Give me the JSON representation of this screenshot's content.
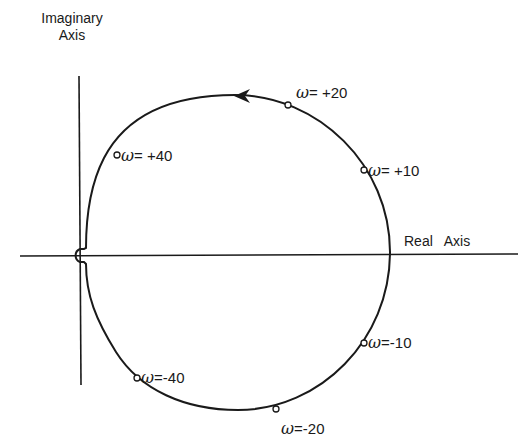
{
  "diagram": {
    "type": "nyquist-plot",
    "colors": {
      "line": "#1a1a1a",
      "background": "#ffffff"
    },
    "axes": {
      "imaginary_label_line1": "Imaginary",
      "imaginary_label_line2": "Axis",
      "real_label": "Real   Axis"
    },
    "points": [
      {
        "symbol": "ω",
        "eq": "= +20",
        "label": "ω= +20"
      },
      {
        "symbol": "ω",
        "eq": "= +40",
        "label": "ω= +40"
      },
      {
        "symbol": "ω",
        "eq": "= +10",
        "label": "ω= +10"
      },
      {
        "symbol": "ω",
        "eq": "=-10",
        "label": "ω=-10"
      },
      {
        "symbol": "ω",
        "eq": "=-40",
        "label": "ω=-40"
      },
      {
        "symbol": "ω",
        "eq": "=-20",
        "label": "ω=-20"
      }
    ],
    "direction_arrow": "counter-clockwise at top of contour"
  }
}
